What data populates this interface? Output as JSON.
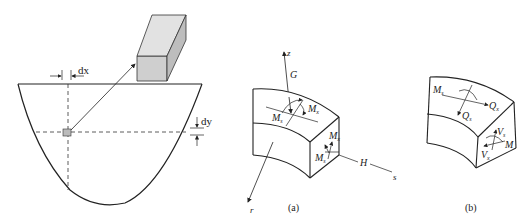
{
  "figure_left": {
    "dx_label": "dx",
    "dy_label": "dy"
  },
  "figure_a": {
    "caption": "(a)",
    "axis_z": "z",
    "axis_r": "r",
    "axis_s": "s",
    "label_G": "G",
    "label_H": "H",
    "top_face": {
      "m1_main": "M",
      "m1_sub": "s",
      "m2_main": "M",
      "m2_sub": "x"
    },
    "side_face": {
      "m1_main": "M",
      "m1_sub": "s",
      "m2_main": "M",
      "m2_sub": "x"
    }
  },
  "figure_b": {
    "caption": "(b)",
    "top_face": {
      "ms_main": "M",
      "ms_sub": "s",
      "qx_main": "Q",
      "qx_sub": "x",
      "qs_main": "Q",
      "qs_sub": "s"
    },
    "side_face": {
      "vs_main": "V",
      "vs_sub": "s",
      "vx_main": "V",
      "vx_sub": "x",
      "m_main": "M"
    }
  }
}
